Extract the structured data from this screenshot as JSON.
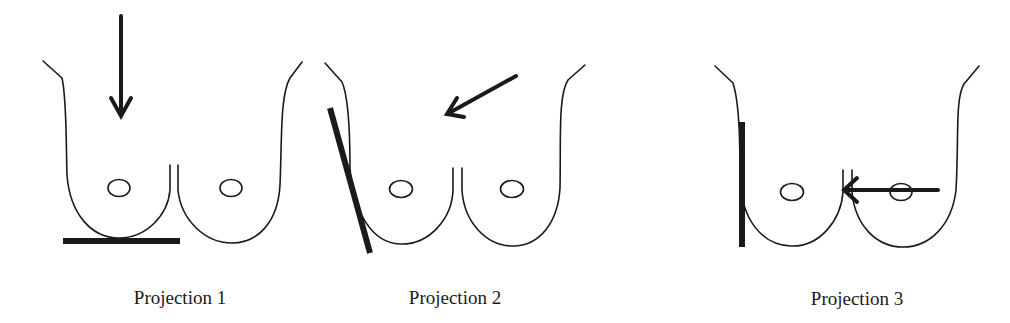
{
  "figure": {
    "width": 1010,
    "height": 323,
    "background": "#ffffff",
    "ink_color": "#1a1a1a",
    "panels": [
      {
        "id": "projection-1",
        "label": "Projection 1",
        "label_pos": [
          180,
          304
        ],
        "left_breast_path": "M43,61 L62,78 C67,100 66,150 67,175 C70,215 92,237 117,238 C146,239 168,215 170,190 L170,165",
        "right_breast_path": "M178,165 L178,190 C181,220 205,243 232,243 C258,243 278,222 280,185 C282,140 280,95 290,78 L302,62",
        "nipples": [
          [
            119,
            188,
            11,
            8.5
          ],
          [
            231,
            188,
            11,
            8.5
          ]
        ],
        "plate": [
          63,
          241,
          180,
          241
        ],
        "arrow": {
          "from": [
            121,
            16
          ],
          "to": [
            121,
            114
          ],
          "head": "M111,98 L121,116 L131,98"
        }
      },
      {
        "id": "projection-2",
        "label": "Projection 2",
        "label_pos": [
          455,
          304
        ],
        "left_breast_path": "M325,63 L342,82 C350,100 350,150 350,168 C353,212 372,243 400,244 C430,245 452,218 453,190 L453,168",
        "right_breast_path": "M462,168 L462,190 C464,222 486,246 513,246 C540,246 558,222 560,188 C561,140 558,95 568,80 L585,65",
        "nipples": [
          [
            401,
            189,
            11.5,
            8.5
          ],
          [
            512,
            189,
            11.5,
            8.5
          ]
        ],
        "plate": [
          330,
          108,
          370,
          253
        ],
        "arrow": {
          "from": [
            516,
            76
          ],
          "to": [
            449,
            113
          ],
          "head": "M457,98 L447,114 L464,117"
        }
      },
      {
        "id": "projection-3",
        "label": "Projection 3",
        "label_pos": [
          857,
          305
        ],
        "left_breast_path": "M715,66 L733,83 C740,105 740,150 740,180 C742,220 762,245 791,246 C820,247 841,220 843,192 L843,170",
        "right_breast_path": "M852,170 L852,192 C855,225 876,247 903,247 C930,247 952,225 956,190 C959,140 955,98 964,84 L979,66",
        "nipples": [
          [
            792,
            192,
            11.5,
            8.5
          ],
          [
            901,
            192,
            11,
            8.5
          ]
        ],
        "plate": [
          742,
          122,
          742,
          247
        ],
        "arrow": {
          "from": [
            938,
            190
          ],
          "to": [
            847,
            190
          ],
          "head": "M857,178 L844,190 L857,202"
        }
      }
    ]
  }
}
